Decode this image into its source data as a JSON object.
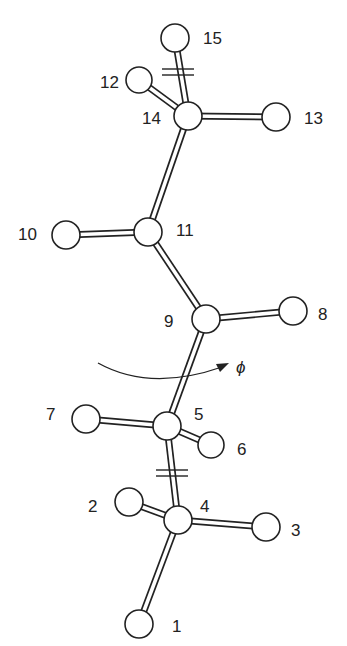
{
  "diagram": {
    "type": "molecular-structure",
    "torsion_label": "ϕ",
    "atoms": [
      {
        "id": "1",
        "x": 139,
        "y": 624,
        "r": 14,
        "label": "1",
        "lx": 172,
        "ly": 632
      },
      {
        "id": "2",
        "x": 129,
        "y": 502,
        "r": 14,
        "label": "2",
        "lx": 88,
        "ly": 512
      },
      {
        "id": "3",
        "x": 266,
        "y": 527,
        "r": 14,
        "label": "3",
        "lx": 291,
        "ly": 536
      },
      {
        "id": "4",
        "x": 178,
        "y": 520,
        "r": 14,
        "label": "4",
        "lx": 200,
        "ly": 512
      },
      {
        "id": "5",
        "x": 167,
        "y": 426,
        "r": 14,
        "label": "5",
        "lx": 194,
        "ly": 420
      },
      {
        "id": "6",
        "x": 211,
        "y": 445,
        "r": 13,
        "label": "6",
        "lx": 237,
        "ly": 455
      },
      {
        "id": "7",
        "x": 86,
        "y": 419,
        "r": 14,
        "label": "7",
        "lx": 46,
        "ly": 420
      },
      {
        "id": "8",
        "x": 293,
        "y": 311,
        "r": 14,
        "label": "8",
        "lx": 318,
        "ly": 320
      },
      {
        "id": "9",
        "x": 206,
        "y": 319,
        "r": 14,
        "label": "9",
        "lx": 164,
        "ly": 327
      },
      {
        "id": "10",
        "x": 66,
        "y": 235,
        "r": 14,
        "label": "10",
        "lx": 18,
        "ly": 240
      },
      {
        "id": "11",
        "x": 148,
        "y": 232,
        "r": 14,
        "label": "11",
        "lx": 176,
        "ly": 236
      },
      {
        "id": "12",
        "x": 139,
        "y": 80,
        "r": 13,
        "label": "12",
        "lx": 100,
        "ly": 88
      },
      {
        "id": "13",
        "x": 276,
        "y": 117,
        "r": 14,
        "label": "13",
        "lx": 304,
        "ly": 124
      },
      {
        "id": "14",
        "x": 188,
        "y": 116,
        "r": 14,
        "label": "14",
        "lx": 142,
        "ly": 124
      },
      {
        "id": "15",
        "x": 175,
        "y": 38,
        "r": 14,
        "label": "15",
        "lx": 203,
        "ly": 44
      }
    ],
    "bonds": [
      [
        "1",
        "4"
      ],
      [
        "2",
        "4"
      ],
      [
        "3",
        "4"
      ],
      [
        "4",
        "5"
      ],
      [
        "5",
        "6"
      ],
      [
        "5",
        "7"
      ],
      [
        "5",
        "9"
      ],
      [
        "9",
        "8"
      ],
      [
        "9",
        "11"
      ],
      [
        "11",
        "10"
      ],
      [
        "11",
        "14"
      ],
      [
        "14",
        "12"
      ],
      [
        "14",
        "13"
      ],
      [
        "14",
        "15"
      ]
    ],
    "break_marks": [
      {
        "x": 172,
        "y": 473
      },
      {
        "x": 178,
        "y": 72
      }
    ],
    "rotation_arrow": {
      "cx": 190,
      "cy": 362,
      "label_x": 236,
      "label_y": 373
    }
  }
}
